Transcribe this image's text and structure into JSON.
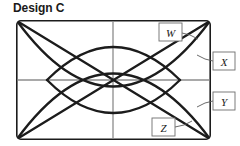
{
  "figure": {
    "title": "Design C",
    "frame": {
      "x": 16,
      "y": 20,
      "width": 195,
      "height": 120,
      "corner_radius": 4,
      "stroke_color": "#1c1c1c"
    },
    "axes": {
      "center_x": 113,
      "center_y": 80,
      "color": "#8c8c8c",
      "horizontal": true,
      "vertical": true
    },
    "curve_color": "#1c1c1c",
    "callout_color": "#6e6e6e",
    "curves": [
      {
        "name": "diagonal-top-left-to-bottom-right",
        "type": "line",
        "points": "18,22 209,138"
      },
      {
        "name": "diagonal-bottom-left-to-top-right",
        "type": "line",
        "points": "18,138 209,22"
      },
      {
        "name": "outer-arc-upper",
        "type": "arc",
        "description": "large arc bowing upward from lower-left corner to lower-right corner"
      },
      {
        "name": "outer-arc-lower",
        "type": "arc",
        "description": "large arc bowing downward from upper-left corner to upper-right corner"
      },
      {
        "name": "inner-arc-upper",
        "type": "arc",
        "description": "smaller arc bowing upward forming inner lens"
      },
      {
        "name": "inner-arc-lower",
        "type": "arc",
        "description": "smaller arc bowing downward forming inner lens"
      }
    ],
    "callouts": [
      {
        "id": "w",
        "label": "W",
        "box": {
          "x": 159,
          "y": 22,
          "width": 23,
          "height": 18
        },
        "leader": "182,33 197,38",
        "position": "inside-top-right"
      },
      {
        "id": "x",
        "label": "X",
        "box": {
          "x": 213,
          "y": 52,
          "width": 22,
          "height": 18
        },
        "leader": "213,61 198,56",
        "position": "outside-right-upper"
      },
      {
        "id": "y",
        "label": "Y",
        "box": {
          "x": 213,
          "y": 92,
          "width": 22,
          "height": 18
        },
        "leader": "213,101 198,106",
        "position": "outside-right-lower"
      },
      {
        "id": "z",
        "label": "Z",
        "box": {
          "x": 152,
          "y": 118,
          "width": 23,
          "height": 18
        },
        "leader": "175,127 191,122",
        "position": "inside-bottom-right"
      }
    ]
  }
}
